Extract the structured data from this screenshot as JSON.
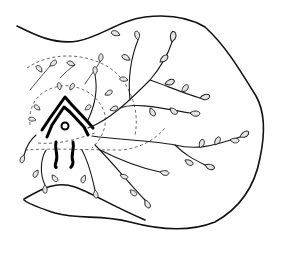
{
  "figure": {
    "colors": {
      "stroke": "#111111",
      "leaf_fill": "#e4e4e4",
      "background": "#ffffff"
    }
  }
}
